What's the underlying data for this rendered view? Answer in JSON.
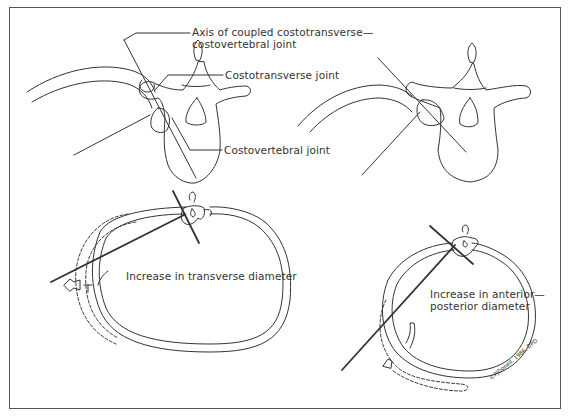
{
  "figure": {
    "panels": [
      {
        "id": "vertebra-left",
        "labels": {
          "axis_line1": "Axis of coupled costotransverse—",
          "axis_line2": "costovertebral joint",
          "costotransverse": "Costotransverse joint",
          "costovertebral": "Costovertebral joint"
        }
      },
      {
        "id": "vertebra-right"
      },
      {
        "id": "ribcage-transverse",
        "label": "Increase in transverse diameter"
      },
      {
        "id": "ribcage-ap",
        "label_line1": "Increase in anterior—",
        "label_line2": "posterior diameter"
      }
    ],
    "signature": "©PJDonell, 1986, DPD"
  },
  "colors": {
    "line": "#333333",
    "frame": "#555555",
    "background": "#ffffff"
  }
}
